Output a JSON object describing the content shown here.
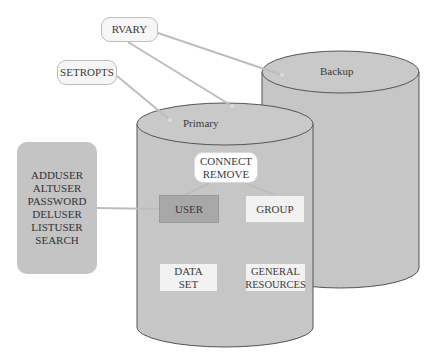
{
  "diagram": {
    "colors": {
      "cylinder_fill": "#c6c6c6",
      "cylinder_stroke": "#555555",
      "connector": "#bdbdbd",
      "user_box": "#a8a8a8",
      "light_box": "#f2f2f2",
      "command_panel": "#c4c4c4"
    },
    "callouts": {
      "rvary": "RVARY",
      "setropts": "SETROPTS"
    },
    "databases": {
      "primary": "Primary",
      "backup": "Backup"
    },
    "connect_remove": {
      "line1": "CONNECT",
      "line2": "REMOVE"
    },
    "profiles": {
      "user": "USER",
      "group": "GROUP",
      "dataset_line1": "DATA",
      "dataset_line2": "SET",
      "general_line1": "GENERAL",
      "general_line2": "RESOURCES"
    },
    "user_commands": [
      "ADDUSER",
      "ALTUSER",
      "PASSWORD",
      "DELUSER",
      "LISTUSER",
      "SEARCH"
    ]
  }
}
